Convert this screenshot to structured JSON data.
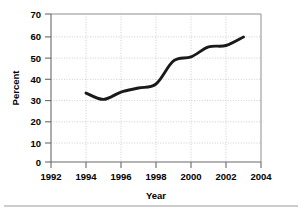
{
  "chart_data": {
    "type": "line",
    "title": "",
    "xlabel": "Year",
    "ylabel": "Percent",
    "xlim": [
      1992,
      2004
    ],
    "ylim": [
      0,
      70
    ],
    "grid": true,
    "legend": null,
    "x_ticks": [
      1992,
      1994,
      1996,
      1998,
      2000,
      2002,
      2004
    ],
    "y_ticks": [
      0,
      10,
      20,
      30,
      40,
      50,
      60,
      70
    ],
    "x": [
      1994,
      1995,
      1996,
      1997,
      1998,
      1999,
      2000,
      2001,
      2002,
      2003
    ],
    "values": [
      32.6,
      29.6,
      33.1,
      35.0,
      36.9,
      47.8,
      49.7,
      54.4,
      55.1,
      59.1
    ],
    "series": [
      {
        "name": "Percent",
        "color": "#1a1a1a",
        "x": [
          1994,
          1995,
          1996,
          1997,
          1998,
          1999,
          2000,
          2001,
          2002,
          2003
        ],
        "values": [
          32.6,
          29.6,
          33.1,
          35.0,
          36.9,
          47.8,
          49.7,
          54.4,
          55.1,
          59.1
        ]
      }
    ]
  },
  "axes": {
    "y_title": "Percent",
    "x_title": "Year",
    "y_tick_labels": [
      "70",
      "60",
      "50",
      "40",
      "30",
      "20",
      "10",
      "0"
    ],
    "x_tick_labels": [
      "1992",
      "1994",
      "1996",
      "1998",
      "2000",
      "2002",
      "2004"
    ]
  },
  "colors": {
    "line": "#1a1a1a",
    "grid": "#b9b9b9",
    "axis": "#6a6a6a",
    "border": "#8d8d8d",
    "text": "#000000",
    "background": "#ffffff"
  }
}
